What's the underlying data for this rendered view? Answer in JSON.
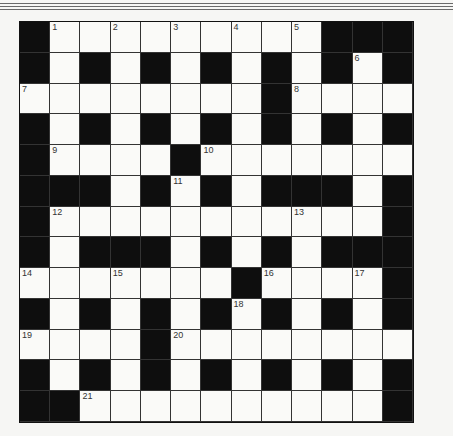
{
  "puzzle": {
    "type": "crossword",
    "rows": 13,
    "cols": 13,
    "legend": {
      "#": "black-square",
      ".": "white-square"
    },
    "layout": [
      "#.........###",
      "#.#.#.#.#.#.#",
      "........#....",
      "#.#.#.#.#.#.#",
      "#....#.......",
      "###.#.#.###.#",
      "#...........#",
      "#.###.#.#.###",
      ".......#....#",
      "#.#.#.#.#.#.#",
      "....#........",
      "#.#.#.#.#.#.#",
      "##..........#"
    ],
    "numbers": [
      {
        "n": "1",
        "r": 0,
        "c": 1
      },
      {
        "n": "2",
        "r": 0,
        "c": 3
      },
      {
        "n": "3",
        "r": 0,
        "c": 5
      },
      {
        "n": "4",
        "r": 0,
        "c": 7
      },
      {
        "n": "5",
        "r": 0,
        "c": 9
      },
      {
        "n": "6",
        "r": 1,
        "c": 11
      },
      {
        "n": "7",
        "r": 2,
        "c": 0
      },
      {
        "n": "8",
        "r": 2,
        "c": 9
      },
      {
        "n": "9",
        "r": 4,
        "c": 1
      },
      {
        "n": "10",
        "r": 4,
        "c": 6
      },
      {
        "n": "11",
        "r": 5,
        "c": 5
      },
      {
        "n": "12",
        "r": 6,
        "c": 1
      },
      {
        "n": "13",
        "r": 6,
        "c": 9
      },
      {
        "n": "14",
        "r": 8,
        "c": 0
      },
      {
        "n": "15",
        "r": 8,
        "c": 3
      },
      {
        "n": "16",
        "r": 8,
        "c": 8
      },
      {
        "n": "17",
        "r": 8,
        "c": 11
      },
      {
        "n": "18",
        "r": 9,
        "c": 7
      },
      {
        "n": "19",
        "r": 10,
        "c": 0
      },
      {
        "n": "20",
        "r": 10,
        "c": 5
      },
      {
        "n": "21",
        "r": 12,
        "c": 2
      }
    ]
  }
}
